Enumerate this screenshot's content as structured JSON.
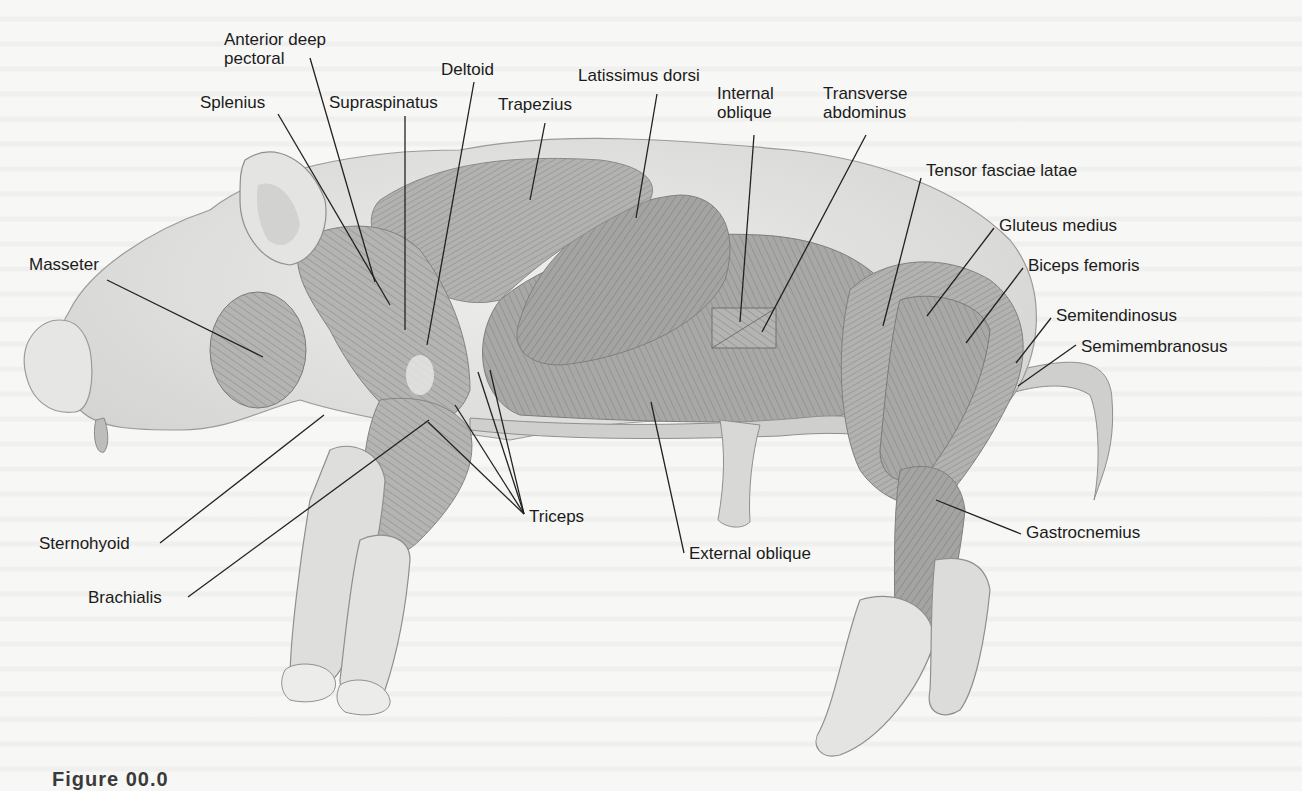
{
  "figure": {
    "caption_partial": "Figure 00.0"
  },
  "labels": [
    {
      "id": "anterior-deep-pectoral",
      "text_lines": [
        "Anterior deep",
        "pectoral"
      ],
      "x": 224,
      "y": 30
    },
    {
      "id": "splenius",
      "text_lines": [
        "Splenius"
      ],
      "x": 200,
      "y": 93
    },
    {
      "id": "supraspinatus",
      "text_lines": [
        "Supraspinatus"
      ],
      "x": 329,
      "y": 93
    },
    {
      "id": "deltoid",
      "text_lines": [
        "Deltoid"
      ],
      "x": 441,
      "y": 60
    },
    {
      "id": "trapezius",
      "text_lines": [
        "Trapezius"
      ],
      "x": 498,
      "y": 95
    },
    {
      "id": "latissimus-dorsi",
      "text_lines": [
        "Latissimus dorsi"
      ],
      "x": 578,
      "y": 66
    },
    {
      "id": "internal-oblique",
      "text_lines": [
        "Internal",
        "oblique"
      ],
      "x": 717,
      "y": 84
    },
    {
      "id": "transverse-abdominus",
      "text_lines": [
        "Transverse",
        "abdominus"
      ],
      "x": 823,
      "y": 84
    },
    {
      "id": "tensor-fasciae-latae",
      "text_lines": [
        "Tensor fasciae latae"
      ],
      "x": 926,
      "y": 161
    },
    {
      "id": "gluteus-medius",
      "text_lines": [
        "Gluteus medius"
      ],
      "x": 999,
      "y": 216
    },
    {
      "id": "biceps-femoris",
      "text_lines": [
        "Biceps femoris"
      ],
      "x": 1028,
      "y": 256
    },
    {
      "id": "semitendinosus",
      "text_lines": [
        "Semitendinosus"
      ],
      "x": 1056,
      "y": 306
    },
    {
      "id": "semimembranosus",
      "text_lines": [
        "Semimembranosus"
      ],
      "x": 1081,
      "y": 337
    },
    {
      "id": "masseter",
      "text_lines": [
        "Masseter"
      ],
      "x": 29,
      "y": 255
    },
    {
      "id": "sternohyoid",
      "text_lines": [
        "Sternohyoid"
      ],
      "x": 39,
      "y": 534
    },
    {
      "id": "brachialis",
      "text_lines": [
        "Brachialis"
      ],
      "x": 88,
      "y": 588
    },
    {
      "id": "triceps",
      "text_lines": [
        "Triceps"
      ],
      "x": 529,
      "y": 507
    },
    {
      "id": "external-oblique",
      "text_lines": [
        "External oblique"
      ],
      "x": 689,
      "y": 544
    },
    {
      "id": "gastrocnemius",
      "text_lines": [
        "Gastrocnemius"
      ],
      "x": 1026,
      "y": 523
    }
  ],
  "leader_lines": [
    {
      "label": "anterior-deep-pectoral",
      "x1": 310,
      "y1": 58,
      "x2": 375,
      "y2": 282
    },
    {
      "label": "splenius",
      "x1": 278,
      "y1": 114,
      "x2": 390,
      "y2": 305
    },
    {
      "label": "supraspinatus",
      "x1": 405,
      "y1": 116,
      "x2": 405,
      "y2": 330
    },
    {
      "label": "deltoid",
      "x1": 474,
      "y1": 82,
      "x2": 427,
      "y2": 345
    },
    {
      "label": "trapezius",
      "x1": 545,
      "y1": 123,
      "x2": 530,
      "y2": 200
    },
    {
      "label": "latissimus-dorsi",
      "x1": 657,
      "y1": 94,
      "x2": 636,
      "y2": 218
    },
    {
      "label": "internal-oblique",
      "x1": 754,
      "y1": 135,
      "x2": 740,
      "y2": 322
    },
    {
      "label": "transverse-abdominus",
      "x1": 866,
      "y1": 135,
      "x2": 762,
      "y2": 332
    },
    {
      "label": "tensor-fasciae-latae",
      "x1": 921,
      "y1": 178,
      "x2": 883,
      "y2": 326
    },
    {
      "label": "gluteus-medius",
      "x1": 994,
      "y1": 228,
      "x2": 927,
      "y2": 316
    },
    {
      "label": "biceps-femoris",
      "x1": 1023,
      "y1": 268,
      "x2": 966,
      "y2": 343
    },
    {
      "label": "semitendinosus",
      "x1": 1051,
      "y1": 318,
      "x2": 1016,
      "y2": 363
    },
    {
      "label": "semimembranosus",
      "x1": 1076,
      "y1": 345,
      "x2": 1018,
      "y2": 386
    },
    {
      "label": "masseter",
      "x1": 107,
      "y1": 280,
      "x2": 263,
      "y2": 357
    },
    {
      "label": "sternohyoid",
      "x1": 160,
      "y1": 543,
      "x2": 324,
      "y2": 415
    },
    {
      "label": "brachialis",
      "x1": 188,
      "y1": 597,
      "x2": 429,
      "y2": 420
    },
    {
      "label": "triceps-1",
      "x1": 524,
      "y1": 514,
      "x2": 428,
      "y2": 422
    },
    {
      "label": "triceps-2",
      "x1": 524,
      "y1": 514,
      "x2": 455,
      "y2": 405
    },
    {
      "label": "triceps-3",
      "x1": 524,
      "y1": 514,
      "x2": 478,
      "y2": 372
    },
    {
      "label": "triceps-4",
      "x1": 524,
      "y1": 514,
      "x2": 490,
      "y2": 370
    },
    {
      "label": "external-oblique",
      "x1": 684,
      "y1": 553,
      "x2": 651,
      "y2": 402
    },
    {
      "label": "gastrocnemius",
      "x1": 1021,
      "y1": 534,
      "x2": 936,
      "y2": 500
    }
  ],
  "colors": {
    "background": "#f7f7f5",
    "skin": "#e2e2e0",
    "skin_outline": "#9a9a98",
    "muscle_dark": "#8e8e8c",
    "muscle_mid": "#a9a9a7",
    "muscle_light": "#c4c4c2",
    "label_text": "#1b1b1b",
    "leader_line": "#222222"
  }
}
